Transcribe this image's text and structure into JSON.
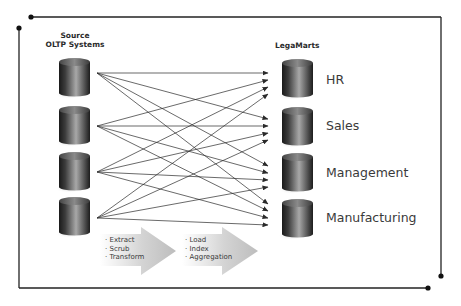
{
  "source": {
    "title_line1": "Source",
    "title_line2": "OLTP Systems",
    "databases": [
      {
        "id": "src-1"
      },
      {
        "id": "src-2"
      },
      {
        "id": "src-3"
      },
      {
        "id": "src-4"
      }
    ]
  },
  "target": {
    "title": "LegaMarts",
    "marts": [
      {
        "label": "HR"
      },
      {
        "label": "Sales"
      },
      {
        "label": "Management"
      },
      {
        "label": "Manufacturing"
      }
    ]
  },
  "process": {
    "stage1": {
      "items": [
        "Extract",
        "Scrub",
        "Transform"
      ]
    },
    "stage2": {
      "items": [
        "Load",
        "Index",
        "Aggregation"
      ]
    }
  },
  "connections": "each source connects to every LegaMart (4x4)",
  "colors": {
    "frame": "#222222",
    "cylinder_dark": "#1e1e1e",
    "cylinder_light": "#9a9a9a",
    "arrow_fill": "#c8c8c8",
    "connector": "#2a2a2a"
  }
}
